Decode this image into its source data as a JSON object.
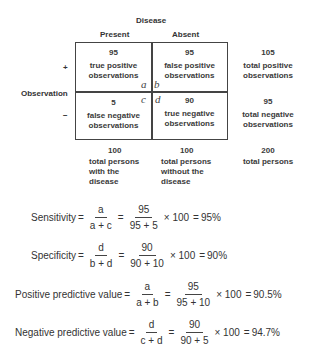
{
  "title": "Disease",
  "columns": {
    "present": "Present",
    "absent": "Absent"
  },
  "row_axis_label": "Observation",
  "rows": {
    "positive": "+",
    "negative": "−"
  },
  "cells": {
    "a": {
      "value": "95",
      "label_line1": "true positive",
      "label_line2": "observations",
      "letter": "a"
    },
    "b": {
      "value": "95",
      "label_line1": "false positive",
      "label_line2": "observations",
      "letter": "b"
    },
    "c": {
      "value": "5",
      "label_line1": "false negative",
      "label_line2": "observations",
      "letter": "c"
    },
    "d": {
      "value": "90",
      "label_line1": "true negative",
      "label_line2": "observations",
      "letter": "d"
    }
  },
  "row_totals": {
    "positive": {
      "value": "105",
      "label_line1": "total positive",
      "label_line2": "observations"
    },
    "negative": {
      "value": "95",
      "label_line1": "total negative",
      "label_line2": "observations"
    }
  },
  "column_totals": {
    "present": {
      "value": "100",
      "line1": "total persons",
      "line2": "with the",
      "line3": "disease"
    },
    "absent": {
      "value": "100",
      "line1": "total persons",
      "line2": "without the",
      "line3": "disease"
    },
    "all": {
      "value": "200",
      "line1": "total persons"
    }
  },
  "formulas": [
    {
      "name": "Sensitivity",
      "eq1": "=",
      "sym_num": "a",
      "sym_den": "a + c",
      "eq2": "=",
      "val_num": "95",
      "val_den": "95 + 5",
      "mult": "× 100",
      "eq3": "=",
      "result": "95%"
    },
    {
      "name": "Specificity",
      "eq1": "=",
      "sym_num": "d",
      "sym_den": "b + d",
      "eq2": "=",
      "val_num": "90",
      "val_den": "90 + 10",
      "mult": "× 100",
      "eq3": "=",
      "result": "90%"
    },
    {
      "name": "Positive predictive value",
      "eq1": "=",
      "sym_num": "a",
      "sym_den": "a + b",
      "eq2": "=",
      "val_num": "95",
      "val_den": "95 + 10",
      "mult": "× 100",
      "eq3": "=",
      "result": "90.5%"
    },
    {
      "name": "Negative predictive value",
      "eq1": "=",
      "sym_num": "d",
      "sym_den": "c + d",
      "eq2": "=",
      "val_num": "90",
      "val_den": "90 + 5",
      "mult": "× 100",
      "eq3": "=",
      "result": "94.7%"
    }
  ]
}
